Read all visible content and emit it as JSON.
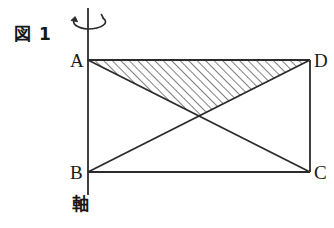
{
  "figure": {
    "caption": "図 1",
    "axis_label": "軸",
    "vertices": {
      "a": "A",
      "b": "B",
      "c": "C",
      "d": "D"
    },
    "colors": {
      "stroke": "#2b2b2b",
      "hatch": "#4a4a4a",
      "background": "#ffffff"
    },
    "geometry": {
      "rect": {
        "a": [
          88,
          60
        ],
        "d": [
          310,
          60
        ],
        "c": [
          310,
          172
        ],
        "b": [
          88,
          172
        ]
      },
      "diagonal_intersection": [
        199,
        116
      ],
      "rotation_axis": {
        "x": 88,
        "y_top": 8,
        "y_bottom": 195
      },
      "hatched_triangle": [
        [
          88,
          60
        ],
        [
          310,
          60
        ],
        [
          199,
          116
        ]
      ],
      "rotation_arrow": {
        "cx": 88,
        "cy": 22,
        "rx": 18,
        "ry": 7
      }
    }
  }
}
